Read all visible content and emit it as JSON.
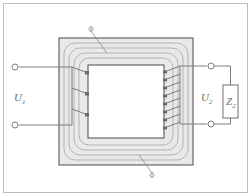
{
  "diagram": {
    "frame": {
      "x": 3,
      "y": 3,
      "width": 245,
      "height": 190,
      "stroke": "#b9b9b9"
    },
    "colors": {
      "core_fill": "#e9e9e9",
      "core_stroke": "#595959",
      "wire": "#7d7d7d",
      "flux_line": "#9a9a9a",
      "label": "#6d6d6d",
      "terminal_fill": "#ffffff",
      "background": "#ffffff"
    },
    "core": {
      "name": "magnetic-core",
      "outer": {
        "x": 59,
        "y": 38,
        "width": 134,
        "height": 127
      },
      "window": {
        "x": 88,
        "y": 65,
        "width": 76,
        "height": 73
      },
      "flux_lines": 4
    },
    "primary": {
      "name": "primary-winding",
      "label": "U",
      "subscript": "1",
      "turns": 3,
      "terminals": [
        {
          "cx": 15,
          "cy": 67
        },
        {
          "cx": 15,
          "cy": 125
        }
      ],
      "label_pos": {
        "x": 14,
        "y": 101
      }
    },
    "secondary": {
      "name": "secondary-winding",
      "label": "U",
      "subscript": "2",
      "turns": 8,
      "terminals": [
        {
          "cx": 211,
          "cy": 66
        },
        {
          "cx": 211,
          "cy": 124
        }
      ],
      "label_pos": {
        "x": 203,
        "y": 101
      }
    },
    "load": {
      "name": "load-impedance",
      "label": "Z",
      "subscript": "2",
      "box": {
        "x": 223,
        "y": 85,
        "width": 15,
        "height": 33
      },
      "label_pos": {
        "x": 227,
        "y": 104
      }
    },
    "annotations": [
      {
        "name": "flux-callout-top",
        "marker_x": 91,
        "marker_y": 30,
        "line_x2": 107,
        "line_y2": 53
      },
      {
        "name": "flux-callout-bottom",
        "marker_x": 152,
        "marker_y": 176,
        "line_x2": 139,
        "line_y2": 155
      }
    ]
  }
}
